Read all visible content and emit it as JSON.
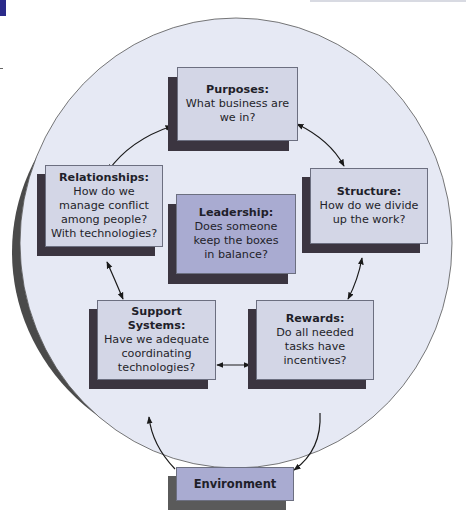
{
  "diagram": {
    "type": "weisbord-six-box-model",
    "colors": {
      "circle_fill": "#e6e9f4",
      "circle_shadow": "#4a4a4a",
      "box_fill": "#d3d6e6",
      "box_fill_accent": "#a9abd1",
      "box_shadow": "#3b3540",
      "arrow": "#1a1a1a",
      "corner_accent": "#2a2a8a"
    },
    "boxes": {
      "purposes": {
        "title": "Purposes:",
        "text": "What business are we in?"
      },
      "structure": {
        "title": "Structure:",
        "text": "How do we divide up the work?"
      },
      "relationships": {
        "title": "Relationships:",
        "text": "How do we manage conflict among people? With technologies?"
      },
      "leadership": {
        "title": "Leadership:",
        "text": "Does someone keep the boxes in balance?"
      },
      "support_systems": {
        "title": "Support Systems:",
        "text": "Have we adequate coordinating technologies?"
      },
      "rewards": {
        "title": "Rewards:",
        "text": "Do all needed tasks have incentives?"
      },
      "environment": {
        "title": "Environment"
      }
    },
    "connections": [
      {
        "from": "purposes",
        "to": "relationships",
        "direction": "both"
      },
      {
        "from": "purposes",
        "to": "structure",
        "direction": "both"
      },
      {
        "from": "structure",
        "to": "rewards",
        "direction": "both"
      },
      {
        "from": "relationships",
        "to": "support_systems",
        "direction": "both"
      },
      {
        "from": "support_systems",
        "to": "rewards",
        "direction": "both"
      },
      {
        "from": "environment",
        "to": "circle",
        "direction": "in"
      },
      {
        "from": "circle",
        "to": "environment",
        "direction": "out"
      }
    ]
  }
}
